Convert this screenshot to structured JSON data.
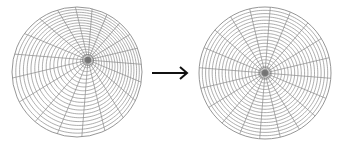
{
  "diagram": {
    "line_color": "#8a8a8a",
    "pole_color": "#6f6f6f",
    "arrow_color": "#111111",
    "left_grid": {
      "label": "distorted-polar-grid",
      "center": [
        77,
        72
      ],
      "radius": 65,
      "pole": [
        88,
        60
      ],
      "rings": 20,
      "spokes": 20
    },
    "right_grid": {
      "label": "regular-polar-grid",
      "center": [
        265,
        73
      ],
      "radius": 66,
      "pole": [
        265,
        73
      ],
      "rings": 20,
      "spokes": 20
    },
    "arrow": {
      "from": [
        152,
        73
      ],
      "to": [
        187,
        73
      ],
      "symbol": "right-arrow"
    }
  }
}
